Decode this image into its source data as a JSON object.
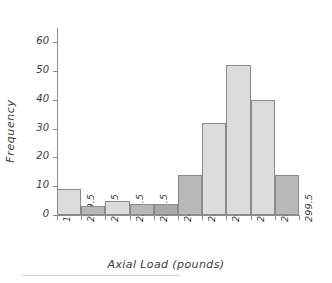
{
  "chart_data": {
    "type": "bar",
    "title": "",
    "subtitle": "",
    "xlabel": "Axial Load (pounds)",
    "ylabel": "Frequency",
    "categories": [
      "199.5 - 209.5",
      "209.5 - 219.5",
      "219.5 - 229.5",
      "229.5 - 239.5",
      "239.5 - 249.5",
      "249.5 - 259.5",
      "259.5 - 269.5",
      "269.5 - 279.5",
      "279.5 - 289.5",
      "289.5 - 299.5"
    ],
    "values": [
      9,
      3,
      5,
      4,
      4,
      14,
      32,
      52,
      40,
      14
    ],
    "bar_colors": [
      "#dcdcda",
      "#b8b8b6",
      "#dcdcda",
      "#b8b8b6",
      "#a9a9a7",
      "#b8b8b6",
      "#dcdcda",
      "#dcdcda",
      "#dcdcda",
      "#b8b8b6"
    ],
    "bar_edge_color": "#8a8a8a",
    "x_tick_labels": [
      "199.5",
      "209.5",
      "219.5",
      "229.5",
      "239.5",
      "249.5",
      "259.5",
      "269.5",
      "279.5",
      "289.5",
      "299.5"
    ],
    "y_tick_labels": [
      "0",
      "10",
      "20",
      "30",
      "40",
      "50",
      "60"
    ],
    "y_tick_values": [
      0,
      10,
      20,
      30,
      40,
      50,
      60
    ],
    "xlim": [
      199.5,
      299.5
    ],
    "ylim": [
      0,
      65
    ],
    "grid": false,
    "legend": "none",
    "axis_color": "#8d8d8d",
    "text_color": "#3b3b3b",
    "background": "#ffffff"
  }
}
